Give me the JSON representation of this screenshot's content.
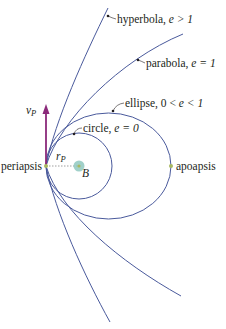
{
  "diagram": {
    "colors": {
      "orbit": "#4a5a9c",
      "velocity_arrow": "#8b2a7a",
      "point": "#a8b860",
      "body": "#8fc8c0",
      "text": "#231f20"
    },
    "labels": {
      "hyperbola": "hyperbola, ",
      "hyperbola_cond": "e > 1",
      "parabola": "parabola, ",
      "parabola_cond": "e = 1",
      "ellipse": "ellipse, 0 < ",
      "ellipse_cond": "e < 1",
      "circle": "circle, ",
      "circle_cond": "e = 0",
      "velocity": "v",
      "velocity_sub": "P",
      "radius": "r",
      "radius_sub": "P",
      "periapsis": "periapsis",
      "apoapsis": "apoapsis",
      "body": "B"
    }
  }
}
